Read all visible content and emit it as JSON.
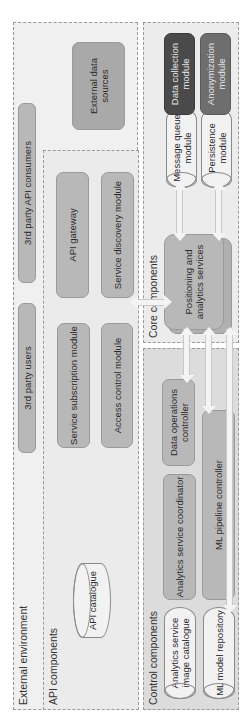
{
  "diagram": {
    "orientation": "rotated 90 degrees counter-clockwise",
    "external_environment": {
      "label": "External environment",
      "third_party_users": "3rd party users",
      "third_party_api_consumers": "3rd party API consumers",
      "external_data_sources": "External data sources"
    },
    "api_components": {
      "label": "API components",
      "api_catalogue": "API catalogue",
      "service_subscription_module": "Service subscription module",
      "access_control_module": "Access control module",
      "api_gateway": "API gateway",
      "service_discovery_module": "Service discovery module"
    },
    "control_components": {
      "label": "Control components",
      "analytics_service_image_catalogue": "Analytics service image catalogue",
      "ml_model_repository": "ML model repository",
      "analytics_service_coordinator": "Analytics service coordinator",
      "ml_pipeline_controller": "ML pipeline controller",
      "data_operations_controller": "Data operations controller"
    },
    "core_components": {
      "label": "Core components",
      "positioning_and_analytics_services": "Positioning and analytics services",
      "message_queue_module": "Message queue module",
      "persistence_module": "Persistence module",
      "data_collection_module": "Data collection module",
      "anonymization_module": "Anonymization module"
    },
    "colors": {
      "zone_bg": "#f0f0f0",
      "control_zone_bg": "#dcdcdc",
      "module_box": "#b8b8b8",
      "data_collection": "#4a4a4a",
      "anonymization": "#6e6e6e",
      "arrow": "#f4f4f4"
    }
  }
}
